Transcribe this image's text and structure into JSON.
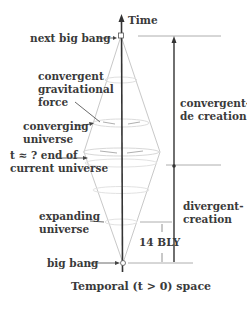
{
  "diagram": {
    "axis_label": "Time",
    "bottom_label": "Temporal (t > 0) space",
    "labels": {
      "next_big_bang": "next big bang",
      "convergent_force": [
        "convergent",
        "gravitational",
        "force"
      ],
      "converging_universe": [
        "converging",
        "universe"
      ],
      "end_current": [
        "t ≈ ? end of",
        "current universe"
      ],
      "expanding_universe": [
        "expanding",
        "universe"
      ],
      "big_bang": "big bang",
      "convergent_de_creation": [
        "convergent-",
        "de creation"
      ],
      "divergent_creation": [
        "divergent-",
        "creation"
      ],
      "duration": "14 BLY"
    },
    "colors": {
      "text": "#3a3a3a",
      "axis": "#333333",
      "cone": "#bdbdbd",
      "guide": "#9a9a9a"
    }
  }
}
